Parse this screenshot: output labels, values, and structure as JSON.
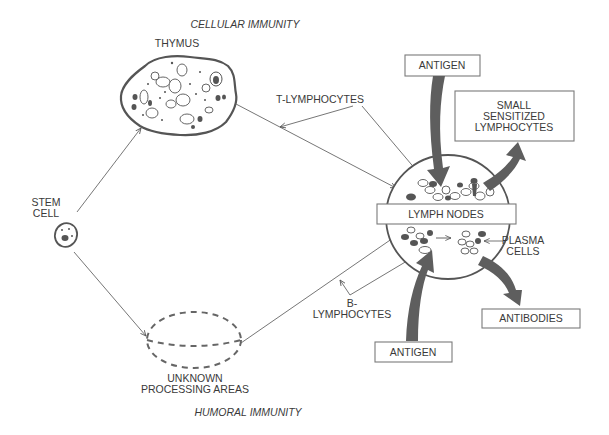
{
  "diagram": {
    "title_top": "CELLULAR IMMUNITY",
    "title_bottom": "HUMORAL IMMUNITY",
    "nodes": {
      "thymus": "THYMUS",
      "stem_cell": [
        "STEM",
        "CELL"
      ],
      "unknown_areas": [
        "UNKNOWN",
        "PROCESSING AREAS"
      ],
      "lymph_nodes": "LYMPH NODES",
      "antigen_top": "ANTIGEN",
      "antigen_bottom": "ANTIGEN",
      "small_sensitized": [
        "SMALL",
        "SENSITIZED",
        "LYMPHOCYTES"
      ],
      "antibodies": "ANTIBODIES",
      "plasma_cells": [
        "PLASMA",
        "CELLS"
      ]
    },
    "edge_labels": {
      "t_lymphocytes": "T-LYMPHOCYTES",
      "b_lymphocytes": [
        "B-",
        "LYMPHOCYTES"
      ]
    },
    "edges": [
      {
        "from": "stem_cell",
        "to": "thymus"
      },
      {
        "from": "stem_cell",
        "to": "unknown_areas"
      },
      {
        "from": "thymus",
        "to": "lymph_nodes",
        "label": "T-LYMPHOCYTES"
      },
      {
        "from": "unknown_areas",
        "to": "lymph_nodes",
        "label": "B-LYMPHOCYTES"
      },
      {
        "from": "antigen_top",
        "to": "lymph_nodes"
      },
      {
        "from": "antigen_bottom",
        "to": "lymph_nodes"
      },
      {
        "from": "lymph_nodes",
        "to": "small_sensitized"
      },
      {
        "from": "lymph_nodes",
        "to": "antibodies"
      }
    ],
    "colors": {
      "stroke": "#555555",
      "arrow_fill": "#5e5e5e",
      "background": "#ffffff"
    }
  }
}
